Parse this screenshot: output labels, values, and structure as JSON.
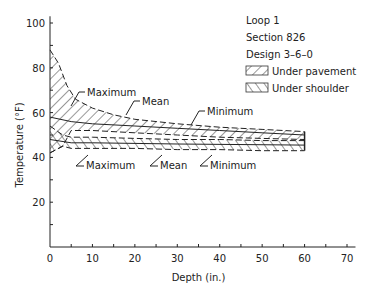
{
  "chart_data": {
    "type": "area",
    "title": "",
    "xlabel": "Depth (in.)",
    "ylabel": "Temperature (°F)",
    "xlim": [
      0,
      70
    ],
    "ylim": [
      0,
      100
    ],
    "xticks": [
      0,
      10,
      20,
      30,
      40,
      50,
      60,
      70
    ],
    "yticks": [
      20,
      40,
      60,
      80,
      100
    ],
    "grid": false,
    "legend_position": "upper right",
    "info_lines": [
      "Loop 1",
      "Section 826",
      "Design 3–6–0"
    ],
    "legend": [
      {
        "label": "Under pavement",
        "pattern": "backslash-hatch"
      },
      {
        "label": "Under shoulder",
        "pattern": "slash-hatch"
      }
    ],
    "series": [
      {
        "name": "Under pavement – Maximum",
        "style": "dashed",
        "points": [
          [
            0,
            88
          ],
          [
            2,
            82
          ],
          [
            4,
            72
          ],
          [
            6,
            66
          ],
          [
            10,
            62
          ],
          [
            15,
            59
          ],
          [
            20,
            57
          ],
          [
            30,
            55
          ],
          [
            40,
            53.5
          ],
          [
            50,
            52.5
          ],
          [
            60,
            51.5
          ]
        ]
      },
      {
        "name": "Under pavement – Mean",
        "style": "solid",
        "points": [
          [
            0,
            58
          ],
          [
            5,
            56
          ],
          [
            10,
            55
          ],
          [
            20,
            54
          ],
          [
            30,
            53
          ],
          [
            40,
            52
          ],
          [
            50,
            51
          ],
          [
            60,
            50
          ]
        ]
      },
      {
        "name": "Under pavement – Minimum",
        "style": "dashed",
        "points": [
          [
            0,
            42
          ],
          [
            3,
            45
          ],
          [
            5,
            52
          ],
          [
            10,
            52
          ],
          [
            20,
            51
          ],
          [
            30,
            50
          ],
          [
            40,
            49
          ],
          [
            50,
            48.5
          ],
          [
            60,
            48
          ]
        ]
      },
      {
        "name": "Under shoulder – Maximum",
        "style": "dashed",
        "points": [
          [
            0,
            54
          ],
          [
            3,
            50
          ],
          [
            5,
            49
          ],
          [
            10,
            49
          ],
          [
            20,
            48.5
          ],
          [
            30,
            48
          ],
          [
            40,
            48
          ],
          [
            50,
            47.5
          ],
          [
            60,
            47.5
          ]
        ]
      },
      {
        "name": "Under shoulder – Mean",
        "style": "solid",
        "points": [
          [
            0,
            48
          ],
          [
            5,
            46.5
          ],
          [
            10,
            46.5
          ],
          [
            30,
            46
          ],
          [
            60,
            45.5
          ]
        ]
      },
      {
        "name": "Under shoulder – Minimum",
        "style": "dashed",
        "points": [
          [
            0,
            42
          ],
          [
            3,
            45
          ],
          [
            5,
            44
          ],
          [
            10,
            44
          ],
          [
            20,
            44
          ],
          [
            30,
            43.5
          ],
          [
            40,
            43.5
          ],
          [
            50,
            43
          ],
          [
            60,
            43
          ]
        ]
      }
    ],
    "annotations": [
      {
        "text": "Maximum",
        "group": "pavement",
        "x": 87,
        "y": 96
      },
      {
        "text": "Mean",
        "group": "pavement",
        "x": 142,
        "y": 105
      },
      {
        "text": "Minimum",
        "group": "pavement",
        "x": 207,
        "y": 115
      },
      {
        "text": "Maximum",
        "group": "shoulder",
        "x": 86,
        "y": 169
      },
      {
        "text": "Mean",
        "group": "shoulder",
        "x": 160,
        "y": 169
      },
      {
        "text": "Minimum",
        "group": "shoulder",
        "x": 210,
        "y": 169
      }
    ]
  }
}
